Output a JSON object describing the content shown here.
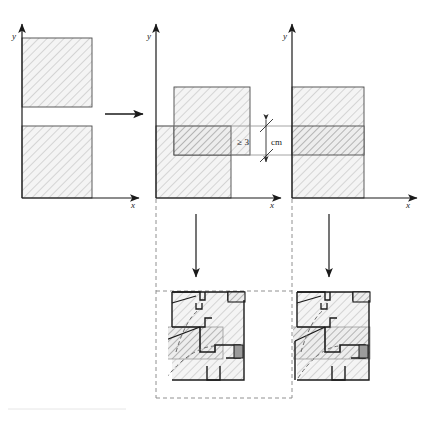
{
  "figure": {
    "type": "technical-diagram",
    "caption": ""
  },
  "axis_labels": {
    "x": "x",
    "y": "y"
  },
  "panels": [
    {
      "id": "panel-initial",
      "name": "initial-state",
      "x_label": "x",
      "y_label": "y",
      "shapes": [
        {
          "name": "upper-rectangle",
          "fill": "hatch-light",
          "x": 0,
          "y": 58,
          "w": 70,
          "h": 46
        },
        {
          "name": "lower-rectangle",
          "fill": "hatch-light",
          "x": 0,
          "y": 0,
          "w": 70,
          "h": 56
        }
      ],
      "note": "two separate rectangles with a gap"
    },
    {
      "id": "panel-overlap",
      "name": "overlap-state",
      "x_label": "x",
      "y_label": "y",
      "shapes": [
        {
          "name": "upper-rectangle-shifted",
          "fill": "hatch-light",
          "x": 13,
          "y": 44,
          "w": 62,
          "h": 60
        },
        {
          "name": "lower-rectangle",
          "fill": "hatch-light",
          "x": 0,
          "y": 0,
          "w": 59,
          "h": 72
        },
        {
          "name": "overlap-band",
          "fill": "hatch-dark",
          "note": "intersection of the two rectangles"
        }
      ],
      "dimension": {
        "name": "overlap-dimension",
        "label": "≥ 3",
        "unit": "cm",
        "full": "≥ 3 cm"
      }
    },
    {
      "id": "panel-merged",
      "name": "merged-state",
      "x_label": "x",
      "y_label": "y",
      "shapes": [
        {
          "name": "merged-rectangle",
          "fill": "hatch-light",
          "x": 0,
          "y": 0,
          "w": 72,
          "h": 104
        },
        {
          "name": "overlap-band",
          "fill": "hatch-dark",
          "note": "horizontal darker band marking the joint"
        }
      ]
    }
  ],
  "connectors": [
    {
      "name": "arrow-initial-to-overlap",
      "direction": "right"
    },
    {
      "name": "arrow-overlap-to-detail-left",
      "direction": "down"
    },
    {
      "name": "arrow-merged-to-detail-right",
      "direction": "down"
    }
  ],
  "details": [
    {
      "id": "detail-left",
      "name": "floor-plan-detail-left",
      "description": "architectural floor plan with hatched band, door swing arcs and wall outlines"
    },
    {
      "id": "detail-right",
      "name": "floor-plan-detail-right",
      "description": "architectural floor plan with hatched band, door swing arcs and wall outlines"
    }
  ],
  "colors": {
    "stroke": "#3a3a3a",
    "hatch_light_fill": "#f2f2f2",
    "hatch_dark_fill": "#e2e2e2",
    "hatch_line": "#9a9a9a",
    "dashed_guide": "#808080",
    "solid_dark": "#808080"
  }
}
